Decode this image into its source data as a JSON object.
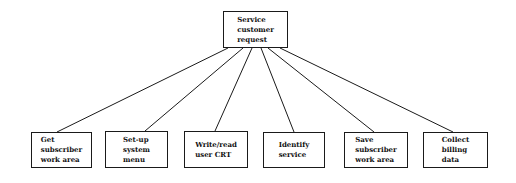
{
  "diagram": {
    "type": "hierarchy-tree",
    "root": {
      "id": "root",
      "label": "Service\ncustomer\nrequest",
      "box": {
        "x": 223,
        "y": 11,
        "w": 65,
        "h": 37
      }
    },
    "children": [
      {
        "id": "c1",
        "label": "Get\nsubscriber\nwork area",
        "box": {
          "x": 31,
          "y": 132,
          "w": 61,
          "h": 36
        },
        "link": {
          "x1": 228,
          "y1": 48,
          "x2": 57,
          "y2": 132
        }
      },
      {
        "id": "c2",
        "label": "Set-up\nsystem\nmenu",
        "box": {
          "x": 105,
          "y": 131,
          "w": 63,
          "h": 37
        },
        "link": {
          "x1": 243,
          "y1": 48,
          "x2": 145,
          "y2": 131
        }
      },
      {
        "id": "c3",
        "label": "Write/read\nuser CRT",
        "box": {
          "x": 184,
          "y": 131,
          "w": 64,
          "h": 37
        },
        "link": {
          "x1": 252,
          "y1": 48,
          "x2": 215,
          "y2": 131
        }
      },
      {
        "id": "c4",
        "label": "Identify\nservice",
        "box": {
          "x": 263,
          "y": 132,
          "w": 62,
          "h": 36
        },
        "link": {
          "x1": 261,
          "y1": 48,
          "x2": 294,
          "y2": 132
        }
      },
      {
        "id": "c5",
        "label": "Save\nsubscriber\nwork area",
        "box": {
          "x": 344,
          "y": 132,
          "w": 64,
          "h": 36
        },
        "link": {
          "x1": 268,
          "y1": 48,
          "x2": 374,
          "y2": 132
        }
      },
      {
        "id": "c6",
        "label": "Collect\nbilling\ndata",
        "box": {
          "x": 423,
          "y": 132,
          "w": 65,
          "h": 36
        },
        "link": {
          "x1": 280,
          "y1": 48,
          "x2": 453,
          "y2": 132
        }
      }
    ],
    "colors": {
      "line": "#1a1a1a",
      "text": "#111111",
      "background": "#ffffff"
    }
  }
}
